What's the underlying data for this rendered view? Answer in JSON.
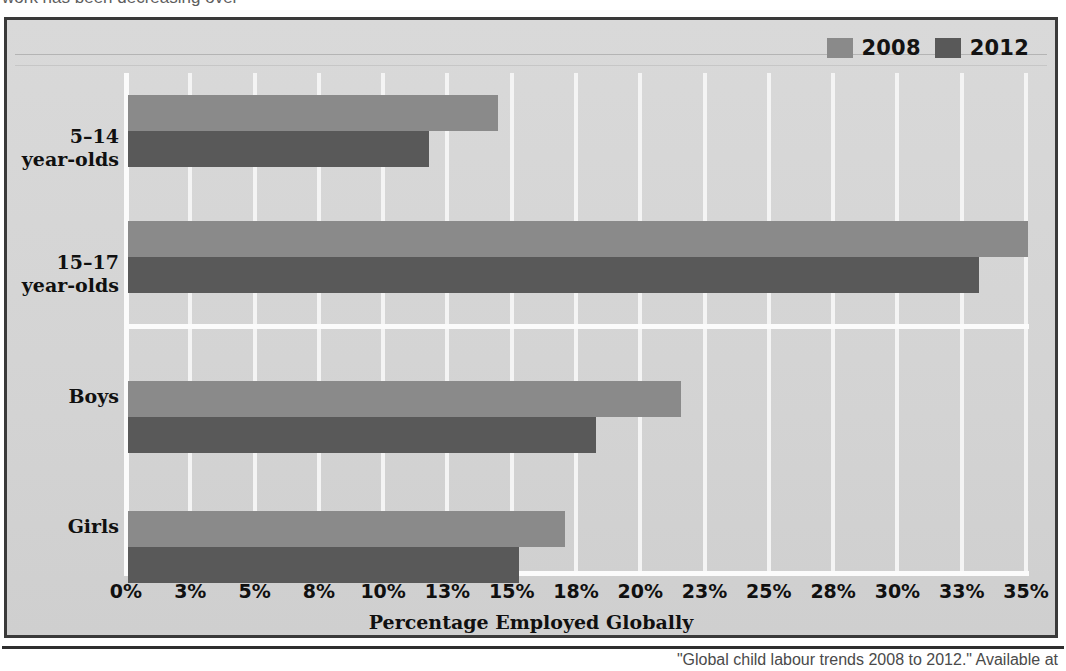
{
  "page": {
    "top_partial_text": "work has been decreasing over",
    "bottom_partial_caption": "\"Global child labour trends 2008 to 2012.\" Available at"
  },
  "legend": {
    "position": "top-right",
    "entries": [
      {
        "label": "2008",
        "color": "#8a8a8a",
        "swatch_name": "legend-swatch-2008"
      },
      {
        "label": "2012",
        "color": "#595959",
        "swatch_name": "legend-swatch-2012"
      }
    ]
  },
  "colors": {
    "series_2008": "#8a8a8a",
    "series_2012": "#595959",
    "plot_background": "#d4d4d4",
    "gridline": "#f4f4f4",
    "frame_border": "#3a3a3a",
    "text": "#101010"
  },
  "chart_data": {
    "type": "bar",
    "orientation": "horizontal",
    "title": "",
    "subtitle": "",
    "xlabel": "Percentage Employed Globally",
    "ylabel": "",
    "xlim": [
      0,
      35
    ],
    "grid": true,
    "legend_position": "top-right",
    "categories": [
      "5–14 year-olds",
      "15–17 year-olds",
      "Boys",
      "Girls"
    ],
    "category_lines": [
      [
        "5–14",
        "year-olds"
      ],
      [
        "15–17",
        "year-olds"
      ],
      [
        "Boys"
      ],
      [
        "Girls"
      ]
    ],
    "tick_labels": [
      "0%",
      "3%",
      "5%",
      "8%",
      "10%",
      "13%",
      "15%",
      "18%",
      "20%",
      "23%",
      "25%",
      "28%",
      "30%",
      "33%",
      "35%"
    ],
    "tick_values": [
      0,
      2.5,
      5,
      7.5,
      10,
      12.5,
      15,
      17.5,
      20,
      22.5,
      25,
      27.5,
      30,
      32.5,
      35
    ],
    "series": [
      {
        "name": "2008",
        "color": "#8a8a8a",
        "values": [
          14.4,
          35.0,
          21.5,
          17.0
        ]
      },
      {
        "name": "2012",
        "color": "#595959",
        "values": [
          11.7,
          33.1,
          18.2,
          15.2
        ]
      }
    ]
  }
}
